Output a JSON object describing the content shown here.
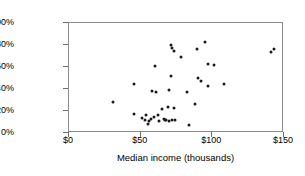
{
  "chart_data": {
    "type": "scatter",
    "title": "",
    "xlabel": "Median income (thousands)",
    "ylabel": "Percent male",
    "xlim": [
      0,
      150
    ],
    "ylim": [
      0,
      100
    ],
    "grid": false,
    "legend": "none",
    "xticks": [
      "$0",
      "$50",
      "$100",
      "$150"
    ],
    "xtick_values": [
      0,
      50,
      100,
      150
    ],
    "yticks": [
      "0%",
      "20%",
      "40%",
      "60%",
      "80%",
      "100%"
    ],
    "ytick_values": [
      0,
      20,
      40,
      60,
      80,
      100
    ],
    "marker": {
      "shape": "circle",
      "color": "#1a1a1a",
      "size": 3
    },
    "points": [
      {
        "x": 31,
        "y": 28
      },
      {
        "x": 45,
        "y": 17
      },
      {
        "x": 45,
        "y": 45
      },
      {
        "x": 51,
        "y": 14
      },
      {
        "x": 53,
        "y": 12
      },
      {
        "x": 54,
        "y": 16
      },
      {
        "x": 55,
        "y": 8
      },
      {
        "x": 56,
        "y": 11
      },
      {
        "x": 57,
        "y": 13
      },
      {
        "x": 58,
        "y": 38
      },
      {
        "x": 59,
        "y": 15
      },
      {
        "x": 60,
        "y": 61
      },
      {
        "x": 61,
        "y": 37
      },
      {
        "x": 62,
        "y": 16
      },
      {
        "x": 63,
        "y": 11
      },
      {
        "x": 65,
        "y": 22
      },
      {
        "x": 66,
        "y": 13
      },
      {
        "x": 67,
        "y": 12
      },
      {
        "x": 68,
        "y": 12
      },
      {
        "x": 69,
        "y": 24
      },
      {
        "x": 70,
        "y": 11
      },
      {
        "x": 70,
        "y": 39
      },
      {
        "x": 71,
        "y": 52
      },
      {
        "x": 71,
        "y": 80
      },
      {
        "x": 72,
        "y": 12
      },
      {
        "x": 72,
        "y": 77
      },
      {
        "x": 73,
        "y": 23
      },
      {
        "x": 73,
        "y": 75
      },
      {
        "x": 74,
        "y": 12
      },
      {
        "x": 78,
        "y": 69
      },
      {
        "x": 82,
        "y": 37
      },
      {
        "x": 84,
        "y": 7
      },
      {
        "x": 88,
        "y": 26
      },
      {
        "x": 89,
        "y": 76
      },
      {
        "x": 90,
        "y": 50
      },
      {
        "x": 92,
        "y": 47
      },
      {
        "x": 95,
        "y": 83
      },
      {
        "x": 97,
        "y": 43
      },
      {
        "x": 97,
        "y": 63
      },
      {
        "x": 101,
        "y": 62
      },
      {
        "x": 108,
        "y": 45
      },
      {
        "x": 141,
        "y": 74
      },
      {
        "x": 143,
        "y": 76
      }
    ]
  }
}
